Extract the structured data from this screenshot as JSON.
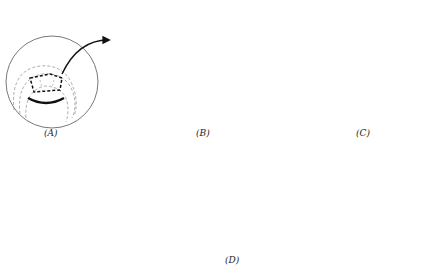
{
  "figure": {
    "panels": [
      {
        "id": "A",
        "label": "(A)",
        "description": "Donor embryo with dashed graft region excised from dorsal lip area"
      },
      {
        "id": "B",
        "label": "(B)",
        "description": "Graft tissue inserted into host embryo"
      },
      {
        "id": "C",
        "label": "(C)",
        "description": "Cross-section showing secondary axis formation"
      },
      {
        "id": "D",
        "label": "(D)",
        "description": "Conjoined twin tadpoles with two heads"
      }
    ]
  }
}
